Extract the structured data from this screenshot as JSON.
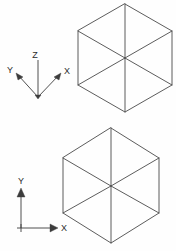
{
  "drawing": {
    "title": "Isometric hexagon views with UCS icons",
    "background_color": "#fefefe",
    "line_color": "#4a4a4a",
    "label_color": "#2b2b2b",
    "width": 176,
    "height": 251
  },
  "views": [
    {
      "name": "top-isometric-view",
      "shape": "hexagon-isometric-cube",
      "description": "Isometric cube drawn as hexagon with three internal edges meeting at center",
      "ucs": {
        "type": "3d-isometric-ucs-icon",
        "origin_label": "",
        "axes": [
          {
            "name": "x-axis",
            "label": "X",
            "direction": "upper-right"
          },
          {
            "name": "y-axis",
            "label": "Y",
            "direction": "upper-left"
          },
          {
            "name": "z-axis",
            "label": "Z",
            "direction": "up"
          }
        ]
      }
    },
    {
      "name": "bottom-isometric-view",
      "shape": "hexagon-isometric-cube",
      "description": "Isometric cube drawn as hexagon with three internal edges meeting at center",
      "ucs": {
        "type": "2d-ucs-icon",
        "origin_label": "",
        "axes": [
          {
            "name": "x-axis",
            "label": "X",
            "direction": "right"
          },
          {
            "name": "y-axis",
            "label": "Y",
            "direction": "up"
          }
        ]
      }
    }
  ],
  "labels": {
    "top_z": "Z",
    "top_y": "Y",
    "top_x": "X",
    "bottom_y": "Y",
    "bottom_x": "X"
  }
}
